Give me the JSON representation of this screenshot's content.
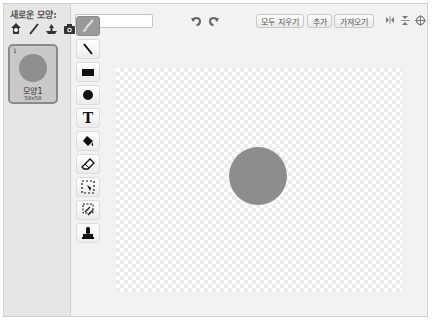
{
  "sidebar": {
    "new_costume_label": "새로운 모양:",
    "new_costume_icons": [
      "choose-from-library-icon",
      "paint-icon",
      "upload-icon",
      "camera-icon"
    ],
    "costumes": [
      {
        "index": "1",
        "name": "모양1",
        "size": "58x58",
        "thumb_color": "#8f8f8f",
        "selected": true
      }
    ]
  },
  "editor": {
    "costume_name_value": "모양1",
    "undo_icon": "undo-icon",
    "redo_icon": "redo-icon",
    "buttons": {
      "clear": "모두 지우기",
      "add": "추가",
      "import": "가져오기"
    },
    "right_icons": [
      "flip-horizontal-icon",
      "flip-vertical-icon",
      "set-center-icon"
    ],
    "tools": [
      {
        "name": "brush",
        "active": true
      },
      {
        "name": "line",
        "active": false
      },
      {
        "name": "rectangle",
        "active": false
      },
      {
        "name": "ellipse",
        "active": false
      },
      {
        "name": "text",
        "active": false
      },
      {
        "name": "fill",
        "active": false
      },
      {
        "name": "eraser",
        "active": false
      },
      {
        "name": "select",
        "active": false
      },
      {
        "name": "select-and-duplicate",
        "active": false
      },
      {
        "name": "stamp",
        "active": false
      }
    ],
    "canvas": {
      "shape": "circle",
      "shape_color": "#8d8d8d"
    }
  }
}
